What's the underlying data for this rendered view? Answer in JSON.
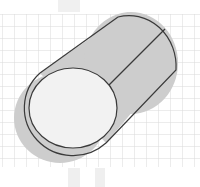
{
  "diagram": {
    "colors": {
      "background": "#ffffff",
      "grid": "#d9d9d9",
      "tube_fill": "#cdcdcd",
      "front_face_fill": "#f2f2f2",
      "stroke": "#3a3a3a",
      "top_smudge": "#e6e6e6"
    },
    "grid": {
      "spacing_px": 12,
      "top": 14,
      "bottom": 167
    },
    "shapes": [
      {
        "name": "cylinder-body",
        "type": "tube"
      },
      {
        "name": "front-face",
        "type": "ellipse"
      },
      {
        "name": "seam-line",
        "type": "line"
      }
    ]
  }
}
